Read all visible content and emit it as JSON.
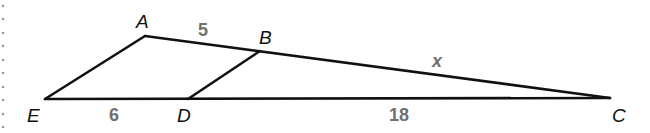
{
  "diagram": {
    "type": "geometry-similar-triangles",
    "colors": {
      "line": "#111111",
      "measure": "#707070",
      "background": "#ffffff"
    },
    "vertices": {
      "A": {
        "label": "A",
        "x": 145,
        "y": 36
      },
      "B": {
        "label": "B",
        "x": 260,
        "y": 51
      },
      "C": {
        "label": "C",
        "x": 610,
        "y": 98
      },
      "D": {
        "label": "D",
        "x": 188,
        "y": 99
      },
      "E": {
        "label": "E",
        "x": 45,
        "y": 99
      }
    },
    "segments": [
      {
        "from": "E",
        "to": "A"
      },
      {
        "from": "A",
        "to": "C"
      },
      {
        "from": "E",
        "to": "C"
      },
      {
        "from": "D",
        "to": "B"
      }
    ],
    "measures": {
      "AB": "5",
      "BC": "x",
      "ED": "6",
      "DC": "18"
    }
  }
}
